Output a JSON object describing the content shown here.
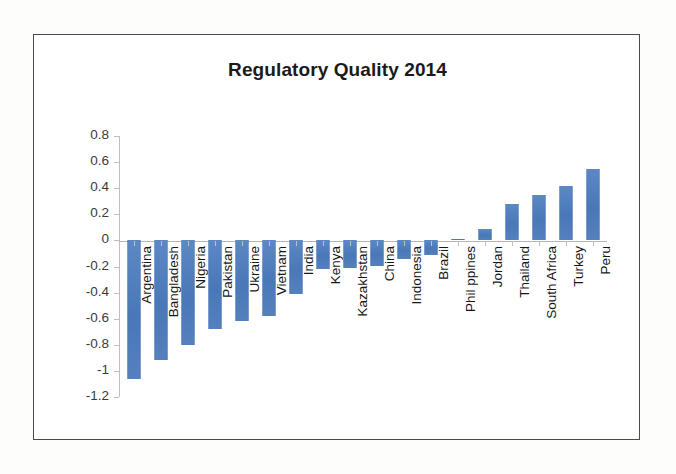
{
  "chart_data": {
    "type": "bar",
    "title": "Regulatory Quality 2014",
    "xlabel": "",
    "ylabel": "",
    "ylim": [
      -1.2,
      0.8
    ],
    "grid": false,
    "legend": "none",
    "y_ticks": [
      "0.8",
      "0.6",
      "0.4",
      "0.2",
      "0",
      "-0.2",
      "-0.4",
      "-0.6",
      "-0.8",
      "-1",
      "-1.2"
    ],
    "y_tick_values": [
      0.8,
      0.6,
      0.4,
      0.2,
      0,
      -0.2,
      -0.4,
      -0.6,
      -0.8,
      -1,
      -1.2
    ],
    "bar_color": "#4f7cba",
    "categories": [
      "Argentina",
      "Bangladesh",
      "Nigeria",
      "Pakistan",
      "Ukraine",
      "Vietnam",
      "India",
      "Kenya",
      "Kazakhstan",
      "China",
      "Indonesia",
      "Brazil",
      "Phil ppines",
      "Jordan",
      "Thailand",
      "South Africa",
      "Turkey",
      "Peru"
    ],
    "values": [
      -1.06,
      -0.92,
      -0.8,
      -0.68,
      -0.62,
      -0.58,
      -0.41,
      -0.22,
      -0.21,
      -0.2,
      -0.14,
      -0.11,
      0.01,
      0.09,
      0.28,
      0.35,
      0.42,
      0.545
    ]
  }
}
